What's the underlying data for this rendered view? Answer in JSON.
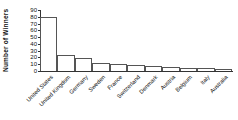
{
  "chart_data": {
    "type": "bar",
    "title": "",
    "xlabel": "",
    "ylabel": "Number of Winners",
    "categories": [
      "United States",
      "United Kingdom",
      "Germany",
      "Sweden",
      "France",
      "Switzerland",
      "Denmark",
      "Austria",
      "Belgium",
      "Italy",
      "Australia"
    ],
    "values": [
      80,
      24,
      19,
      12,
      10,
      9,
      8,
      6,
      5,
      4,
      3
    ],
    "ylim": [
      0,
      90
    ],
    "yticks": [
      0,
      10,
      20,
      30,
      40,
      50,
      60,
      70,
      80,
      90
    ],
    "grid": false,
    "legend": null,
    "colors": {
      "bar_fill": "#ffffff",
      "bar_border": "#555555",
      "axis": "#333333",
      "text": "#111111"
    }
  }
}
